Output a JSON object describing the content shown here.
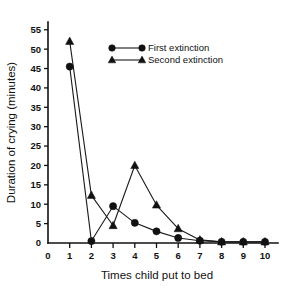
{
  "chart_data": {
    "type": "line",
    "title": "",
    "subtitle": "",
    "xlabel": "Times child put to bed",
    "ylabel": "Duration of crying (minutes)",
    "x": [
      1,
      2,
      3,
      4,
      5,
      6,
      7,
      8,
      9,
      10
    ],
    "xlim": [
      0,
      10.6
    ],
    "ylim": [
      0,
      57
    ],
    "xticks": [
      0,
      1,
      2,
      3,
      4,
      5,
      6,
      7,
      8,
      9,
      10
    ],
    "xtick_labels": [
      "0",
      "1",
      "2",
      "3",
      "4",
      "5",
      "6",
      "7",
      "8",
      "9",
      "10"
    ],
    "yticks": [
      0,
      5,
      10,
      15,
      20,
      25,
      30,
      35,
      40,
      45,
      50,
      55
    ],
    "ytick_labels": [
      "0",
      "5",
      "10",
      "15",
      "20",
      "25",
      "30",
      "35",
      "40",
      "45",
      "50",
      "55"
    ],
    "grid": false,
    "legend_position": "top-center",
    "series": [
      {
        "name": "First extinction",
        "marker": "circle",
        "color": "#111111",
        "values": [
          45.5,
          0.5,
          9.5,
          5.2,
          3.0,
          1.3,
          0.6,
          0.3,
          0.3,
          0.3
        ]
      },
      {
        "name": "Second extinction",
        "marker": "triangle",
        "color": "#111111",
        "values": [
          52.0,
          12.3,
          4.5,
          20.0,
          9.8,
          3.7,
          0.8,
          0.3,
          0.3,
          0.3
        ]
      }
    ]
  },
  "legend": {
    "entries": [
      {
        "label": "First extinction",
        "marker": "circle"
      },
      {
        "label": "Second extinction",
        "marker": "triangle"
      }
    ]
  }
}
